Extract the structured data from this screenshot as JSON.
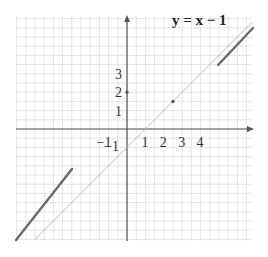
{
  "chart_data": {
    "type": "line",
    "title": "y = x − 1",
    "xlabel": "",
    "ylabel": "",
    "grid": true,
    "grid_minor_step": 0.5,
    "xlim": [
      -6.0,
      6.8
    ],
    "ylim": [
      -6.1,
      6.1
    ],
    "x_tick_labels": [
      "−1",
      "1",
      "2",
      "3",
      "4"
    ],
    "x_ticks": [
      -1,
      1,
      2,
      3,
      4
    ],
    "y_tick_labels": [
      "−1",
      "1",
      "2",
      "3"
    ],
    "y_ticks": [
      -1,
      1,
      2,
      3
    ],
    "series": [
      {
        "name": "y = x − 1",
        "style": "thin",
        "color": "#b8b8b8",
        "points": [
          [
            -5.0,
            -6.0
          ],
          [
            6.8,
            5.8
          ]
        ]
      },
      {
        "name": "thick-segment-upper",
        "style": "thick",
        "color": "#6a6a6a",
        "points": [
          [
            4.95,
            3.48
          ],
          [
            6.85,
            5.49
          ]
        ]
      },
      {
        "name": "thick-segment-lower",
        "style": "thick",
        "color": "#6a6a6a",
        "points": [
          [
            -6.03,
            -6.03
          ],
          [
            -2.99,
            -2.17
          ]
        ]
      }
    ],
    "markers": [
      {
        "name": "point-on-line",
        "x": 2.5,
        "y": 1.5
      },
      {
        "name": "y-axis-tick-2",
        "x": 0,
        "y": 2
      }
    ]
  },
  "colors": {
    "grid": "#dddddd",
    "axis": "#555555",
    "thin_line": "#b8b8b8",
    "thick_line": "#6a6a6a",
    "text": "#333333"
  }
}
